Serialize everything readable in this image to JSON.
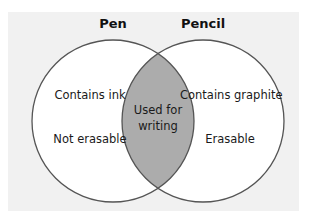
{
  "diagram": {
    "type": "venn",
    "colors": {
      "background": "#f1f1f1",
      "circle_fill": "#ffffff",
      "overlap_fill": "#acacac",
      "stroke": "#555555"
    },
    "sets": [
      {
        "title": "Pen",
        "items": [
          "Contains ink",
          "Not erasable"
        ]
      },
      {
        "title": "Pencil",
        "items": [
          "Contains graphite",
          "Erasable"
        ]
      }
    ],
    "overlap": {
      "line1": "Used for",
      "line2": "writing"
    }
  }
}
